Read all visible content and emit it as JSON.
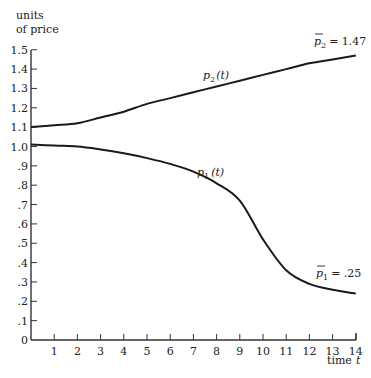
{
  "chart_data": {
    "type": "line",
    "title": "",
    "xlabel": "time t",
    "ylabel": "units of price",
    "xlim": [
      0,
      14
    ],
    "ylim": [
      0,
      1.5
    ],
    "grid": false,
    "x_ticks": [
      1,
      2,
      3,
      4,
      5,
      6,
      7,
      8,
      9,
      10,
      11,
      12,
      13,
      14
    ],
    "x_tick_labels": [
      "1",
      "2",
      "3",
      "4",
      "5",
      "6",
      "7",
      "8",
      "9",
      "10",
      "11",
      "12",
      "13",
      "14"
    ],
    "y_ticks": [
      0,
      0.1,
      0.2,
      0.3,
      0.4,
      0.5,
      0.6,
      0.7,
      0.8,
      0.9,
      1.0,
      1.1,
      1.2,
      1.3,
      1.4,
      1.5
    ],
    "y_tick_labels": [
      "0",
      ".1",
      ".2",
      ".3",
      ".4",
      ".5",
      ".6",
      ".7",
      ".8",
      ".9",
      "1.0",
      "1.1",
      "1.2",
      "1.3",
      "1.4",
      "1.5"
    ],
    "x": [
      0,
      1,
      2,
      3,
      4,
      5,
      6,
      7,
      8,
      9,
      10,
      11,
      12,
      13,
      14
    ],
    "series": [
      {
        "name": "p2(t)",
        "values": [
          1.1,
          1.11,
          1.12,
          1.15,
          1.18,
          1.22,
          1.25,
          1.28,
          1.31,
          1.34,
          1.37,
          1.4,
          1.43,
          1.45,
          1.47
        ]
      },
      {
        "name": "p1(t)",
        "values": [
          1.01,
          1.005,
          1.0,
          0.985,
          0.965,
          0.94,
          0.91,
          0.87,
          0.81,
          0.72,
          0.52,
          0.36,
          0.29,
          0.26,
          0.24
        ]
      }
    ],
    "annotations": [
      {
        "text": "p̄2 = 1.47",
        "x": 14,
        "y": 1.47,
        "series": "p2(t)"
      },
      {
        "text": "p̄1 = .25",
        "x": 14,
        "y": 0.25,
        "series": "p1(t)"
      },
      {
        "text": "p2(t)",
        "x": 8,
        "y": 1.33
      },
      {
        "text": "p1(t)",
        "x": 8,
        "y": 0.84
      }
    ]
  },
  "labels": {
    "ylabel_line1": "units",
    "ylabel_line2": "of price",
    "xlabel": "time",
    "xlabel_var": "t",
    "p2_label_main": "p",
    "p2_label_sub": "2",
    "p2_label_arg": "(t)",
    "p1_label_main": "p",
    "p1_label_sub": "1",
    "p1_label_arg": "(t)",
    "p2_eq_main": "p",
    "p2_eq_sub": "2",
    "p2_eq_value": "= 1.47",
    "p1_eq_main": "p",
    "p1_eq_sub": "1",
    "p1_eq_value": "= .25"
  }
}
